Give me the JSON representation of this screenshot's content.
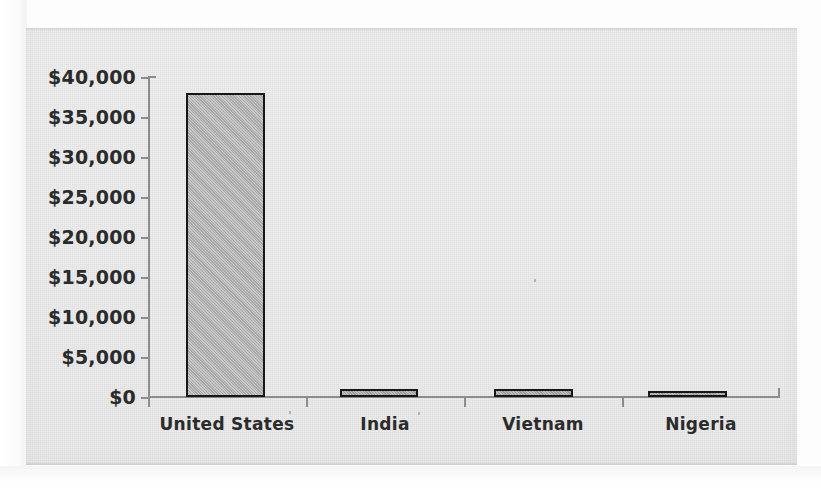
{
  "chart_data": {
    "type": "bar",
    "title": "",
    "subtitle": "",
    "xlabel": "",
    "ylabel": "",
    "categories": [
      "United States",
      "India",
      "Vietnam",
      "Nigeria"
    ],
    "values": [
      38000,
      1000,
      1000,
      800
    ],
    "ylim": [
      0,
      40000
    ],
    "y_ticks": [
      0,
      5000,
      10000,
      15000,
      20000,
      25000,
      30000,
      35000,
      40000
    ],
    "y_tick_labels": [
      "$0",
      "$5,000",
      "$10,000",
      "$15,000",
      "$20,000",
      "$25,000",
      "$30,000",
      "$35,000",
      "$40,000"
    ],
    "grid": false,
    "legend": false,
    "legend_position": "none",
    "series": [
      {
        "name": "",
        "values": [
          38000,
          1000,
          1000,
          800
        ]
      }
    ],
    "colors": {
      "bar_fill": "#a9a9a9",
      "bar_outline": "#171717",
      "axis": "#8c8c8c",
      "text": "#2b2b2b",
      "panel_background": "#ededed",
      "page_background": "#fdfdfd"
    }
  },
  "axis": {
    "y_labels": [
      "$40,000",
      "$35,000",
      "$30,000",
      "$25,000",
      "$20,000",
      "$15,000",
      "$10,000",
      "$5,000",
      "$0"
    ],
    "x_labels": [
      "United States",
      "India",
      "Vietnam",
      "Nigeria"
    ]
  }
}
